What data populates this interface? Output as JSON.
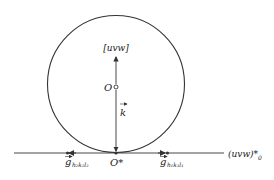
{
  "diagram": {
    "type": "ewald-sphere-construction",
    "labels": {
      "direction": "[uvw]",
      "center": "O",
      "wave_vector": "k",
      "origin": "O*",
      "plane": "(uvw)*",
      "plane_sub": "0",
      "g_left": "g",
      "g_left_sub": "h₂k₂l₂",
      "g_right": "g",
      "g_right_sub": "h₁k₁l₁"
    },
    "colors": {
      "stroke": "#333333",
      "text": "#222222",
      "background": "#ffffff"
    }
  }
}
